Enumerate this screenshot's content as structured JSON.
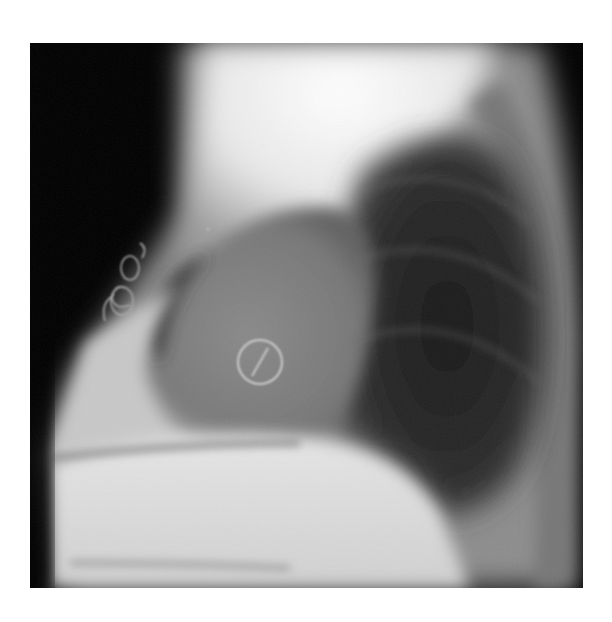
{
  "image": {
    "kind": "lateral chest radiograph",
    "background": "#ffffff",
    "frame": {
      "x": 30,
      "y": 43,
      "width": 553,
      "height": 545
    },
    "features": [
      {
        "name": "sternotomy-wires",
        "description": "looped sternal wire sutures along anterior chest"
      },
      {
        "name": "prosthetic-valve-ring",
        "description": "circular ring with diagonal strut over heart shadow",
        "cx": 260,
        "cy": 362,
        "r": 22
      },
      {
        "name": "heart-shadow",
        "description": "enlarged cardiac silhouette"
      },
      {
        "name": "lung-field",
        "description": "dark aerated posterior lung region"
      },
      {
        "name": "diaphragm",
        "description": "bright dome at lower field"
      }
    ]
  }
}
